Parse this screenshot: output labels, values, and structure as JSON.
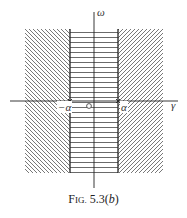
{
  "figure": {
    "caption_prefix_F": "F",
    "caption_prefix_rest": "IG.",
    "caption_number": " 5.3(",
    "caption_sub": "b",
    "caption_close": ")"
  },
  "axes": {
    "x_label": "γ",
    "y_label": "ω",
    "origin_label": "O",
    "left_mark_label": "−α",
    "right_mark_label": "α"
  },
  "regions": {
    "left": "diagonal hatching (\\\\) for γ < −α",
    "center": "horizontal hatching strip −α < γ < α",
    "right": "diagonal hatching (//) for γ > α"
  },
  "colors": {
    "line": "#222222",
    "hatch": "#555555",
    "background": "#ffffff"
  }
}
